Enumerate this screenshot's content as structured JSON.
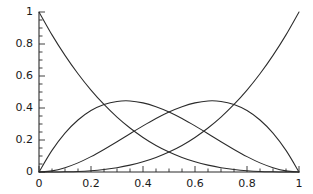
{
  "chart_data": {
    "type": "line",
    "title": "",
    "subtitle": "",
    "xlabel": "",
    "ylabel": "",
    "xlim": [
      0,
      1
    ],
    "ylim": [
      0,
      1
    ],
    "grid": false,
    "legend": "none",
    "x_ticks": [
      0,
      0.2,
      0.4,
      0.6,
      0.8,
      1
    ],
    "x_tick_labels": [
      "0",
      "0.2",
      "0.4",
      "0.6",
      "0.8",
      "1"
    ],
    "y_ticks": [
      0,
      0.2,
      0.4,
      0.6,
      0.8,
      1
    ],
    "y_tick_labels": [
      "0",
      "0.2",
      "0.4",
      "0.6",
      "0.8",
      "1"
    ],
    "x_minor_tick_step": 0.05,
    "y_minor_tick_step": 0.05,
    "spines": [
      "left",
      "bottom"
    ],
    "line_color": "#2b2b2b",
    "background_color": "#ffffff",
    "x": [
      0,
      0.05,
      0.1,
      0.15,
      0.2,
      0.25,
      0.3,
      0.35,
      0.4,
      0.45,
      0.5,
      0.55,
      0.6,
      0.65,
      0.7,
      0.75,
      0.8,
      0.85,
      0.9,
      0.95,
      1
    ],
    "series": [
      {
        "name": "B0 = (1-t)^3",
        "values": [
          1,
          0.857,
          0.729,
          0.614,
          0.512,
          0.422,
          0.343,
          0.275,
          0.216,
          0.166,
          0.125,
          0.091,
          0.064,
          0.043,
          0.027,
          0.016,
          0.008,
          0.003,
          0.001,
          0.0,
          0
        ]
      },
      {
        "name": "B1 = 3t(1-t)^2",
        "values": [
          0,
          0.135,
          0.243,
          0.325,
          0.384,
          0.422,
          0.441,
          0.444,
          0.432,
          0.408,
          0.375,
          0.334,
          0.288,
          0.239,
          0.189,
          0.141,
          0.096,
          0.057,
          0.027,
          0.007,
          0
        ]
      },
      {
        "name": "B2 = 3t^2(1-t)",
        "values": [
          0,
          0.007,
          0.027,
          0.057,
          0.096,
          0.141,
          0.189,
          0.239,
          0.288,
          0.334,
          0.375,
          0.408,
          0.432,
          0.444,
          0.441,
          0.422,
          0.384,
          0.325,
          0.243,
          0.135,
          0
        ]
      },
      {
        "name": "B3 = t^3",
        "values": [
          0,
          0.0,
          0.001,
          0.003,
          0.008,
          0.016,
          0.027,
          0.043,
          0.064,
          0.091,
          0.125,
          0.166,
          0.216,
          0.275,
          0.343,
          0.422,
          0.512,
          0.614,
          0.729,
          0.857,
          1
        ]
      }
    ],
    "annotations": []
  },
  "axes": {
    "y_labels": [
      "1",
      "0.8",
      "0.6",
      "0.4",
      "0.2",
      "0"
    ],
    "x_labels": [
      "0",
      "0.2",
      "0.4",
      "0.6",
      "0.8",
      "1"
    ]
  }
}
